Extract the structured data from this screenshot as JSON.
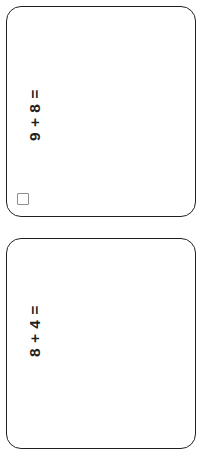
{
  "page": {
    "background_color": "#ffffff",
    "card_border_color": "#231f20",
    "text_color": "#231f20",
    "checkbox_border_color": "#8e8e8e"
  },
  "cards": [
    {
      "id": "card-1",
      "problem": "9 + 8 =",
      "operand_left": "9",
      "operator": "+",
      "operand_right": "8",
      "equals": "=",
      "has_checkbox": true,
      "checkbox_checked": false,
      "clipped": false
    },
    {
      "id": "card-2",
      "problem": "8 + 4 =",
      "operand_left": "8",
      "operator": "+",
      "operand_right": "4",
      "equals": "=",
      "has_checkbox": false,
      "checkbox_checked": false,
      "clipped": true
    }
  ]
}
